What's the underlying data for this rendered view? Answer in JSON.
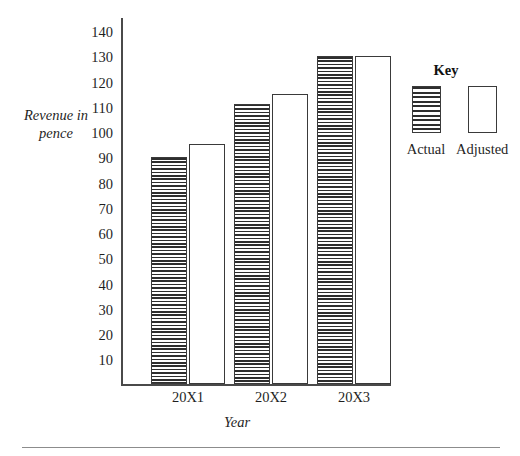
{
  "chart_data": {
    "type": "bar",
    "title": "",
    "xlabel": "Year",
    "ylabel": "Revenue in pence",
    "categories": [
      "20X1",
      "20X2",
      "20X3"
    ],
    "series": [
      {
        "name": "Actual",
        "values": [
          90,
          111,
          130
        ]
      },
      {
        "name": "Adjusted",
        "values": [
          95,
          115,
          130
        ]
      }
    ],
    "ylim": [
      0,
      145
    ],
    "yticks": [
      10,
      20,
      30,
      40,
      50,
      60,
      70,
      80,
      90,
      100,
      110,
      120,
      130,
      140
    ],
    "ytick_labels": [
      "10",
      "20",
      "30",
      "40",
      "50",
      "60",
      "70",
      "80",
      "90",
      "100",
      "110",
      "120",
      "130",
      "140"
    ],
    "grid": false,
    "legend_position": "right",
    "legend_title": "Key"
  },
  "axis": {
    "y_title_line1": "Revenue in",
    "y_title_line2": "pence",
    "x_title": "Year"
  },
  "key": {
    "title": "Key",
    "entries": [
      {
        "label": "Actual",
        "fill": "hatched"
      },
      {
        "label": "Adjusted",
        "fill": "white"
      }
    ]
  },
  "colors": {
    "axis": "#4a4a4a",
    "bar_outline": "#3a3a3a",
    "hatch": "#2e2e2e",
    "background": "#ffffff",
    "text": "#1f1f1f",
    "footer_rule": "#8c8c8c"
  }
}
